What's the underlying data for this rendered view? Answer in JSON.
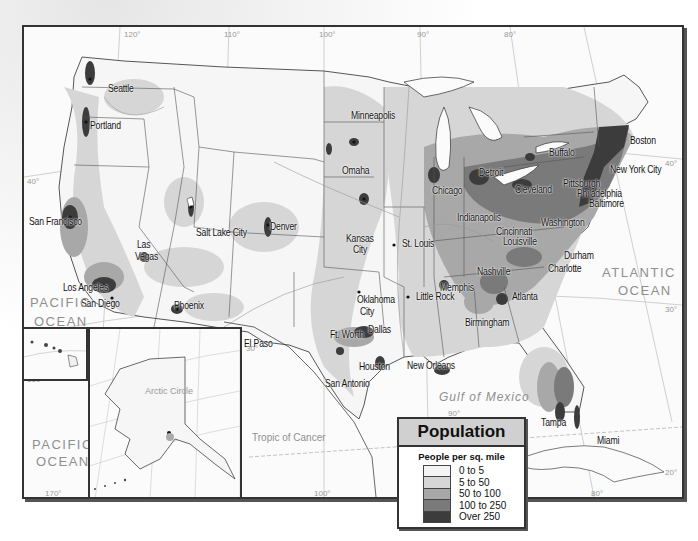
{
  "map": {
    "title": "Population",
    "region": "United States",
    "legend": {
      "title": "Population",
      "subtitle": "People per sq. mile",
      "classes": [
        {
          "label": "0 to 5",
          "color": "#f4f4f4"
        },
        {
          "label": "5 to 50",
          "color": "#d6d6d6"
        },
        {
          "label": "50 to 100",
          "color": "#a8a8a8"
        },
        {
          "label": "100 to 250",
          "color": "#7a7a7a"
        },
        {
          "label": "Over 250",
          "color": "#3c3c3c"
        }
      ]
    },
    "cities": [
      {
        "name": "Seattle",
        "x": 84,
        "y": 55
      },
      {
        "name": "Portland",
        "x": 66,
        "y": 92
      },
      {
        "name": "San Francisco",
        "x": 5,
        "y": 188
      },
      {
        "name": "Los Angeles",
        "x": 39,
        "y": 254
      },
      {
        "name": "San Diego",
        "x": 57,
        "y": 270
      },
      {
        "name": "Las",
        "x": 113,
        "y": 211
      },
      {
        "name": "Vegas",
        "x": 111,
        "y": 223
      },
      {
        "name": "Salt Lake City",
        "x": 172,
        "y": 199
      },
      {
        "name": "Denver",
        "x": 246,
        "y": 193
      },
      {
        "name": "Phoenix",
        "x": 150,
        "y": 272
      },
      {
        "name": "El Paso",
        "x": 220,
        "y": 310
      },
      {
        "name": "Minneapolis",
        "x": 327,
        "y": 82
      },
      {
        "name": "Omaha",
        "x": 318,
        "y": 137
      },
      {
        "name": "Kansas",
        "x": 322,
        "y": 205
      },
      {
        "name": "City",
        "x": 329,
        "y": 216
      },
      {
        "name": "St. Louis",
        "x": 378,
        "y": 210
      },
      {
        "name": "Oklahoma",
        "x": 333,
        "y": 266
      },
      {
        "name": "City",
        "x": 336,
        "y": 278
      },
      {
        "name": "Little Rock",
        "x": 392,
        "y": 263
      },
      {
        "name": "Ft. Worth",
        "x": 306,
        "y": 301
      },
      {
        "name": "Dallas",
        "x": 344,
        "y": 296
      },
      {
        "name": "Houston",
        "x": 335,
        "y": 333
      },
      {
        "name": "San Antonio",
        "x": 301,
        "y": 350
      },
      {
        "name": "New Orleans",
        "x": 383,
        "y": 332
      },
      {
        "name": "Chicago",
        "x": 408,
        "y": 157
      },
      {
        "name": "Detroit",
        "x": 455,
        "y": 139
      },
      {
        "name": "Cleveland",
        "x": 491,
        "y": 156
      },
      {
        "name": "Indianapolis",
        "x": 433,
        "y": 184
      },
      {
        "name": "Cincinnati",
        "x": 472,
        "y": 198
      },
      {
        "name": "Louisville",
        "x": 479,
        "y": 208
      },
      {
        "name": "Memphis",
        "x": 416,
        "y": 254
      },
      {
        "name": "Nashville",
        "x": 453,
        "y": 238
      },
      {
        "name": "Birmingham",
        "x": 441,
        "y": 289
      },
      {
        "name": "Atlanta",
        "x": 488,
        "y": 263
      },
      {
        "name": "Charlotte",
        "x": 524,
        "y": 235
      },
      {
        "name": "Durham",
        "x": 540,
        "y": 222
      },
      {
        "name": "Washington",
        "x": 517,
        "y": 189
      },
      {
        "name": "Baltimore",
        "x": 565,
        "y": 170
      },
      {
        "name": "Pittsburgh",
        "x": 539,
        "y": 150
      },
      {
        "name": "Philadelphia",
        "x": 553,
        "y": 160
      },
      {
        "name": "Buffalo",
        "x": 525,
        "y": 119
      },
      {
        "name": "Boston",
        "x": 606,
        "y": 107
      },
      {
        "name": "New York City",
        "x": 586,
        "y": 136
      },
      {
        "name": "Tampa",
        "x": 517,
        "y": 389
      },
      {
        "name": "Miami",
        "x": 573,
        "y": 407
      },
      {
        "name": "Honolulu",
        "x": 19,
        "y": 312
      },
      {
        "name": "Anchorage",
        "x": 126,
        "y": 395
      }
    ],
    "water_labels": [
      {
        "name": "PACIFIC",
        "x": 6,
        "y": 268
      },
      {
        "name": "OCEAN",
        "x": 10,
        "y": 287
      },
      {
        "name": "ATLANTIC",
        "x": 578,
        "y": 238
      },
      {
        "name": "OCEAN",
        "x": 594,
        "y": 256
      },
      {
        "name": "Gulf of Mexico",
        "x": 415,
        "y": 363
      },
      {
        "name": "PACIFIC",
        "x": 8,
        "y": 410
      },
      {
        "name": "OCEAN",
        "x": 12,
        "y": 427
      }
    ],
    "other_labels": {
      "arctic_circle": "Arctic Circle",
      "tropic_of_cancer": "Tropic of Cancer"
    },
    "graticule_labels": [
      {
        "text": "120°",
        "x": 100,
        "y": 3
      },
      {
        "text": "110°",
        "x": 200,
        "y": 3
      },
      {
        "text": "100°",
        "x": 295,
        "y": 3
      },
      {
        "text": "90°",
        "x": 393,
        "y": 3
      },
      {
        "text": "80°",
        "x": 480,
        "y": 3
      },
      {
        "text": "40°",
        "x": 3,
        "y": 150
      },
      {
        "text": "40°",
        "x": 641,
        "y": 132
      },
      {
        "text": "30°",
        "x": 3,
        "y": 308
      },
      {
        "text": "30°",
        "x": 641,
        "y": 278
      },
      {
        "text": "30°",
        "x": 222,
        "y": 317
      },
      {
        "text": "20°",
        "x": 641,
        "y": 441
      },
      {
        "text": "90°",
        "x": 424,
        "y": 382
      },
      {
        "text": "80°",
        "x": 567,
        "y": 462
      },
      {
        "text": "100°",
        "x": 290,
        "y": 462
      },
      {
        "text": "120°",
        "x": 100,
        "y": 322
      },
      {
        "text": "20°",
        "x": 15,
        "y": 335
      },
      {
        "text": "160°",
        "x": 3,
        "y": 348
      },
      {
        "text": "170°",
        "x": 21,
        "y": 462
      },
      {
        "text": "160°",
        "x": 70,
        "y": 462
      },
      {
        "text": "150°",
        "x": 110,
        "y": 462
      },
      {
        "text": "140°",
        "x": 148,
        "y": 462
      },
      {
        "text": "60°",
        "x": 182,
        "y": 408
      },
      {
        "text": "65°",
        "x": 183,
        "y": 380
      },
      {
        "text": "70°",
        "x": 168,
        "y": 349
      }
    ]
  }
}
